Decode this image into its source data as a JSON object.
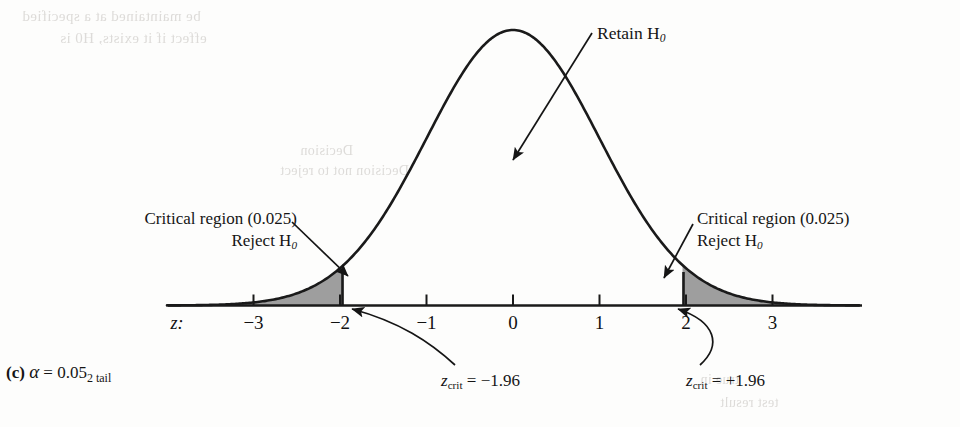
{
  "figure": {
    "caption_letter": "(c)",
    "caption_symbol": "α",
    "caption_equals": "=",
    "caption_value": "0.05",
    "caption_subscript": "2 tail",
    "axis_name": "z:"
  },
  "annotations": {
    "retain": "Retain H",
    "retain_sub": "0",
    "critical_left_line1": "Critical region (0.025)",
    "critical_left_line2_prefix": "Reject H",
    "critical_left_line2_sub": "0",
    "critical_right_line1": "Critical region (0.025)",
    "critical_right_line2_prefix": "Reject H",
    "critical_right_line2_sub": "0",
    "zcrit_left_var": "z",
    "zcrit_left_sub": "crit",
    "zcrit_left_eq": " = −1.96",
    "zcrit_right_var": "z",
    "zcrit_right_sub": "crit",
    "zcrit_right_eq": " = +1.96"
  },
  "ghost_text": {
    "line_a": "be maintained at a specified",
    "line_b": "effect if it exists, H0 is",
    "line_c": "Decision",
    "line_d": "Decision not to reject",
    "line_e": "true in",
    "line_f": "test result"
  },
  "chart_data": {
    "type": "area",
    "title": "",
    "subtitle": "",
    "xlabel": "z:",
    "ylabel": "",
    "distribution": "standard normal",
    "mean": 0,
    "sd": 1,
    "xlim": [
      -4.0,
      4.0
    ],
    "ylim": [
      0,
      0.4
    ],
    "grid": false,
    "legend": "none",
    "tick_values": [
      -3,
      -2,
      -1,
      0,
      1,
      2,
      3
    ],
    "tick_labels": [
      "−3",
      "−2",
      "−1",
      "0",
      "1",
      "2",
      "3"
    ],
    "critical_values": [
      -1.96,
      1.96
    ],
    "tail_area_each": 0.025,
    "alpha_total": 0.05,
    "tails": 2,
    "shaded_regions": [
      {
        "name": "left critical region",
        "from": -4.0,
        "to": -1.96,
        "area": 0.025,
        "fill": "#9e9e9e"
      },
      {
        "name": "right critical region",
        "from": 1.96,
        "to": 4.0,
        "area": 0.025,
        "fill": "#9e9e9e"
      }
    ],
    "retain_region": {
      "from": -1.96,
      "to": 1.96,
      "area": 0.95
    },
    "colors": {
      "curve": "#1a1a1a",
      "axis": "#1a1a1a",
      "shade": "#9e9e9e",
      "text": "#151515"
    }
  }
}
